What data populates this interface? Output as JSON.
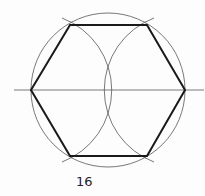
{
  "figure": {
    "label": "16",
    "colors": {
      "thin_line": "#555555",
      "thick_line": "#1a1a1a",
      "text": "#222222"
    }
  }
}
